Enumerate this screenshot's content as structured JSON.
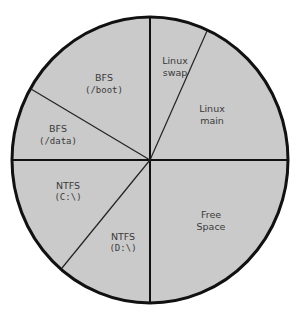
{
  "diagram": {
    "colors": {
      "fill": "#cacaca",
      "outline": "#111111",
      "text": "#3a3a3a",
      "background": "#ffffff"
    },
    "partitions": [
      {
        "id": "linux-swap",
        "line1": "Linux",
        "line2": "swap"
      },
      {
        "id": "linux-main",
        "line1": "Linux",
        "line2": "main"
      },
      {
        "id": "free-space",
        "line1": "Free",
        "line2": "Space"
      },
      {
        "id": "ntfs-d",
        "line1": "NTFS",
        "line2": "(D:\\)"
      },
      {
        "id": "ntfs-c",
        "line1": "NTFS",
        "line2": "(C:\\)"
      },
      {
        "id": "bfs-data",
        "line1": "BFS",
        "line2": "(/data)"
      },
      {
        "id": "bfs-boot",
        "line1": "BFS",
        "line2": "(/boot)"
      }
    ]
  }
}
